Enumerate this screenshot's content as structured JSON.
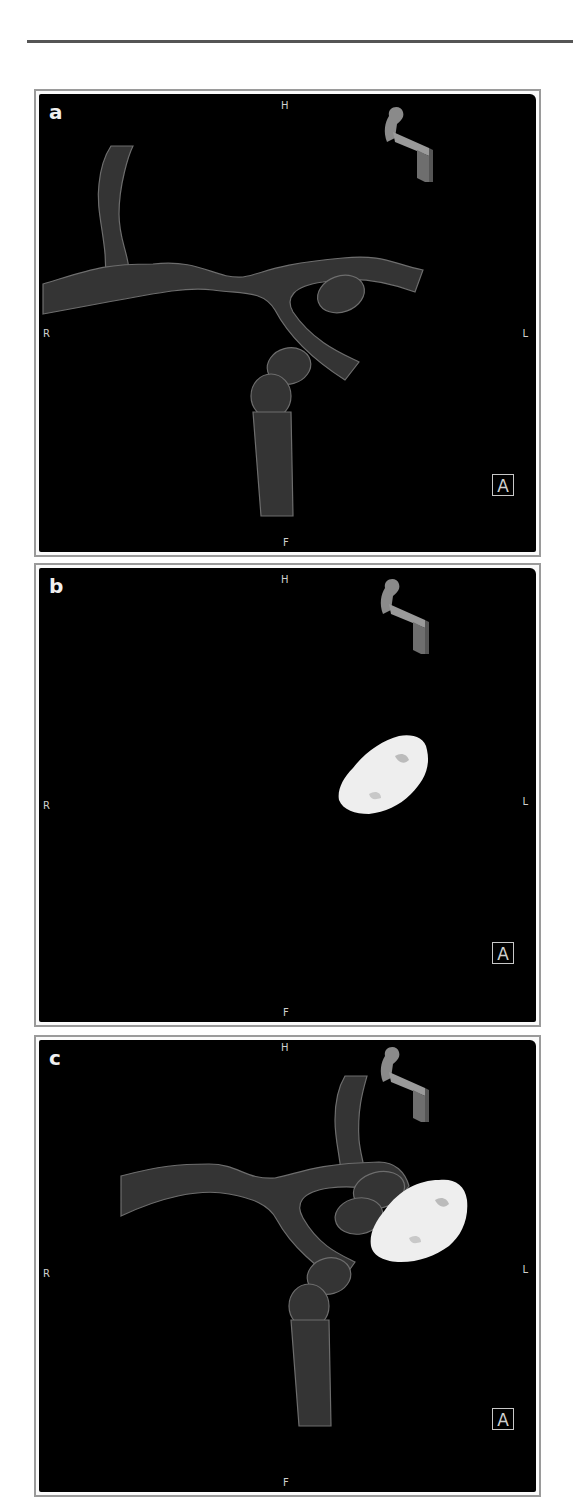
{
  "figure": {
    "panels": [
      {
        "id": "a",
        "letter": "a",
        "content": "3D vessel mesh (translucent arteries)",
        "orientation": {
          "top": "H",
          "bottom": "F",
          "left": "R",
          "right": "L"
        },
        "view_badge": "A",
        "icons": [
          "head-orientation-icon"
        ]
      },
      {
        "id": "b",
        "letter": "b",
        "content": "3D aneurysm/mass segmentation (white blob)",
        "orientation": {
          "top": "H",
          "bottom": "F",
          "left": "R",
          "right": "L"
        },
        "view_badge": "A",
        "icons": [
          "head-orientation-icon"
        ]
      },
      {
        "id": "c",
        "letter": "c",
        "content": "Combined vessel mesh with white mass overlay",
        "orientation": {
          "top": "H",
          "bottom": "F",
          "left": "R",
          "right": "L"
        },
        "view_badge": "A",
        "icons": [
          "head-orientation-icon"
        ]
      }
    ],
    "colors": {
      "background": "#000000",
      "vessel": "#6a6a6a",
      "mass": "#f2f2f2",
      "frame": "#9a9a9a",
      "label": "#cfcfcf"
    }
  }
}
